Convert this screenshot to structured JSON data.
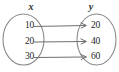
{
  "diagram": {
    "type": "mapping-diagram",
    "domain_label": "x",
    "range_label": "y",
    "background_color": "#ffffff",
    "stroke_color": "#8a8a8a",
    "text_color": "#1e1e1e",
    "pairs": [
      {
        "input": "10",
        "output": "20"
      },
      {
        "input": "20",
        "output": "40"
      },
      {
        "input": "30",
        "output": "60"
      }
    ]
  }
}
